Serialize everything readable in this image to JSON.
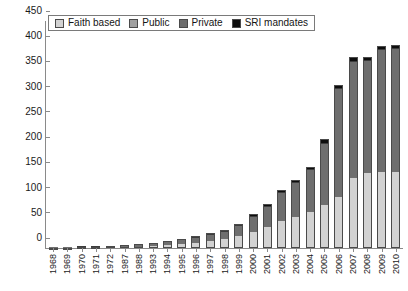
{
  "chart_data": {
    "type": "bar",
    "stacked": true,
    "title": "",
    "subtitle": "",
    "xlabel": "",
    "ylabel": "",
    "ylim": [
      0,
      450
    ],
    "ytick_step": 50,
    "yticks": [
      450,
      400,
      350,
      300,
      250,
      200,
      150,
      100,
      50,
      0
    ],
    "grid": false,
    "legend_position": "top-left",
    "categories": [
      "1968",
      "1969",
      "1970",
      "1971",
      "1972",
      "1987",
      "1988",
      "1993",
      "1994",
      "1995",
      "1996",
      "1997",
      "1998",
      "1999",
      "2000",
      "2001",
      "2002",
      "2003",
      "2004",
      "2005",
      "2006",
      "2007",
      "2008",
      "2009",
      "2010"
    ],
    "series": [
      {
        "name": "Faith based",
        "color": "#d2d2d2",
        "values": [
          1,
          1,
          2,
          2,
          3,
          4,
          5,
          6,
          8,
          10,
          13,
          16,
          20,
          26,
          34,
          44,
          55,
          63,
          74,
          86,
          103,
          140,
          150,
          152,
          152
        ]
      },
      {
        "name": "Public",
        "color": "#a0a0a0",
        "values": [
          0,
          0,
          0,
          0,
          0,
          0,
          0,
          0,
          0,
          0,
          0,
          0,
          0,
          0,
          0,
          0,
          0,
          0,
          0,
          0,
          0,
          0,
          0,
          0,
          0
        ]
      },
      {
        "name": "Private",
        "color": "#6e6e6e",
        "values": [
          0,
          0,
          1,
          1,
          1,
          2,
          2,
          4,
          5,
          7,
          9,
          11,
          14,
          20,
          30,
          40,
          55,
          67,
          82,
          123,
          215,
          230,
          223,
          243,
          245
        ]
      },
      {
        "name": "SRI mandates",
        "color": "#0d0d0d",
        "values": [
          0,
          0,
          0,
          0,
          0,
          0,
          0,
          0,
          1,
          1,
          1,
          2,
          2,
          2,
          3,
          4,
          5,
          5,
          5,
          8,
          6,
          8,
          5,
          5,
          5
        ]
      }
    ]
  },
  "legend": {
    "items": [
      {
        "label": "Faith based",
        "swatch": "faith"
      },
      {
        "label": "Public",
        "swatch": "public"
      },
      {
        "label": "Private",
        "swatch": "private"
      },
      {
        "label": "SRI mandates",
        "swatch": "sri"
      }
    ]
  },
  "colors": {
    "faith_based": "#d2d2d2",
    "public": "#a0a0a0",
    "private": "#6e6e6e",
    "sri_mandates": "#0d0d0d",
    "axis": "#8a8a8a",
    "text": "#1a1a1a",
    "background": "#ffffff"
  }
}
